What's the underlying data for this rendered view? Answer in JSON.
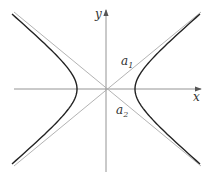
{
  "diagram": {
    "type": "hyperbola",
    "labels": {
      "x_axis": "x",
      "y_axis": "y",
      "asymptote_1": "a",
      "asymptote_1_sub": "1",
      "asymptote_2": "a",
      "asymptote_2_sub": "2"
    },
    "colors": {
      "curve": "#222222",
      "axes": "#888888",
      "asymptotes": "#aaaaaa"
    }
  }
}
